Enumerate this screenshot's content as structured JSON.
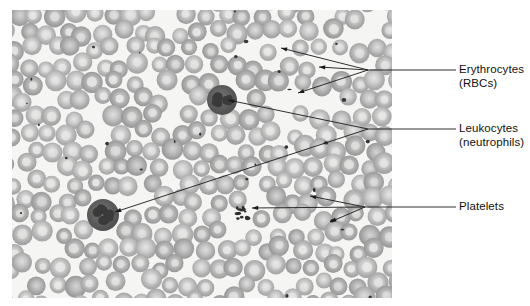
{
  "figure": {
    "kind": "light-micrograph",
    "background_color": "#ffffff",
    "plate": {
      "x": 12,
      "y": 10,
      "width": 380,
      "height": 288,
      "field_color": "#f4f4f2",
      "cell_fill": "#a9a9a9",
      "cell_rim": "#9a9a9a",
      "cell_center": "#d8d8d6",
      "nucleus_color": "#3a3a3a",
      "platelet_color": "#2e2e2e"
    },
    "leader_color": "#1a1a1a",
    "leader_width": 0.9
  },
  "labels": [
    {
      "id": "erythrocytes",
      "name": "Erythrocytes",
      "line1": "Erythrocytes",
      "line2": "(RBCs)",
      "text_x": 459,
      "text_y": 63,
      "stem_y": 70,
      "stem_x_start": 368,
      "stem_x_end": 456,
      "targets": [
        {
          "x": 281,
          "y": 48
        },
        {
          "x": 319,
          "y": 67
        },
        {
          "x": 298,
          "y": 93
        }
      ]
    },
    {
      "id": "leukocytes",
      "name": "Leukocytes",
      "line1": "Leukocytes",
      "line2": "(neutrophils)",
      "text_x": 459,
      "text_y": 122,
      "stem_y": 129,
      "stem_x_start": 368,
      "stem_x_end": 456,
      "targets": [
        {
          "x": 228,
          "y": 100
        },
        {
          "x": 115,
          "y": 212
        }
      ]
    },
    {
      "id": "platelets",
      "name": "Platelets",
      "line1": "Platelets",
      "line2": "",
      "text_x": 459,
      "text_y": 200,
      "stem_y": 207,
      "stem_x_start": 365,
      "stem_x_end": 456,
      "targets": [
        {
          "x": 310,
          "y": 196
        },
        {
          "x": 252,
          "y": 208
        },
        {
          "x": 330,
          "y": 222
        }
      ]
    }
  ],
  "cell_field": {
    "description": "densely packed biconcave erythrocytes with pale central pallor, two dark multilobed neutrophils, and scattered small dark platelets",
    "erythrocyte_count_approx": 330,
    "leukocytes": [
      {
        "cx": 222,
        "cy": 100,
        "r": 15
      },
      {
        "cx": 103,
        "cy": 215,
        "r": 16
      }
    ],
    "platelet_clusters": [
      {
        "cx": 243,
        "cy": 213,
        "n": 12
      },
      {
        "cx": 310,
        "cy": 196,
        "n": 1
      },
      {
        "cx": 331,
        "cy": 223,
        "n": 2
      }
    ]
  }
}
